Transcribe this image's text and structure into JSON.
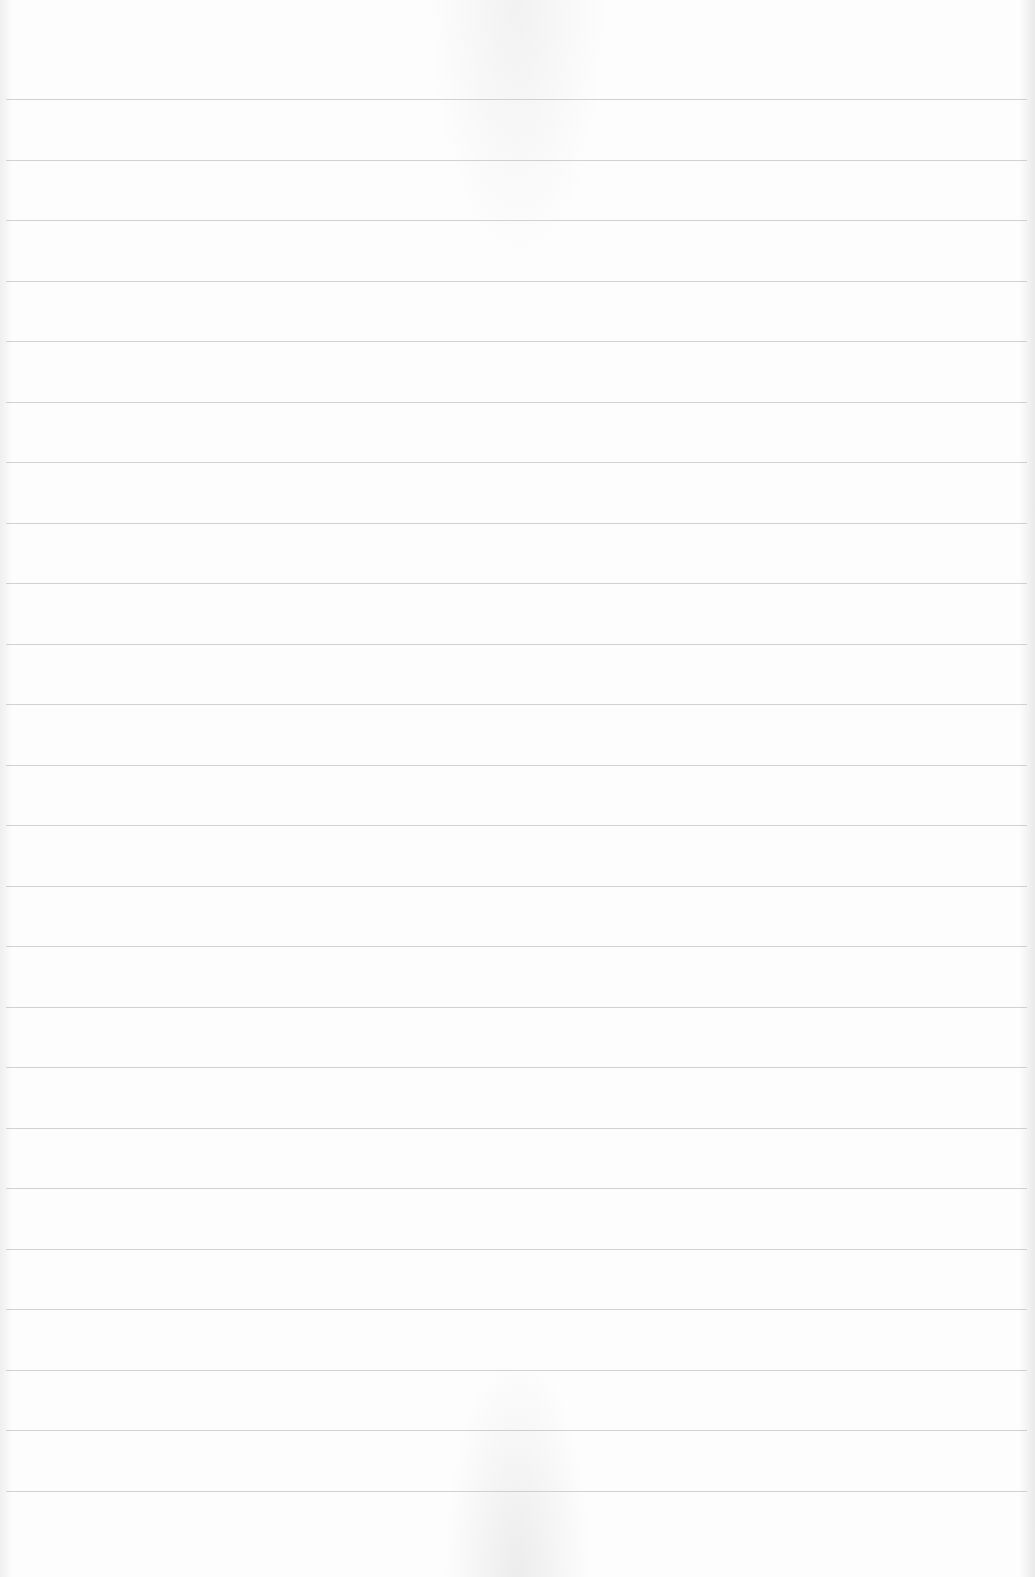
{
  "document": {
    "type": "ruled-paper",
    "background_color": "#fdfdfd",
    "rule_color": "#c9c9c9",
    "rule_count": 24,
    "first_rule_y": 99,
    "rule_spacing": 60.5,
    "text": ""
  }
}
